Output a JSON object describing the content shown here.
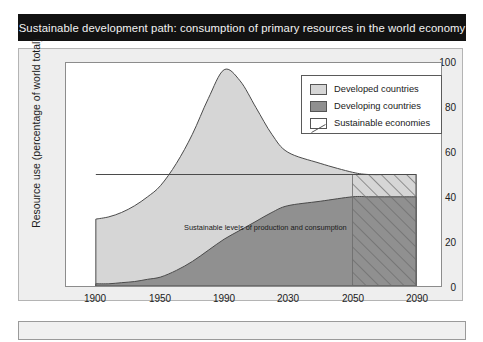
{
  "figure": {
    "title": "Sustainable development path: consumption of primary resources in the world economy",
    "background_color": "#ffffff",
    "title_bar_color": "#121212",
    "panel_color": "#eeeeee"
  },
  "legend": {
    "items": [
      {
        "label": "Developed countries",
        "color": "#d5d5d5",
        "swatch": "solid-light-gray"
      },
      {
        "label": "Developing countries",
        "color": "#8f8f8f",
        "swatch": "solid-dark-gray"
      },
      {
        "label": "Sustainable economies",
        "color": "#ffffff",
        "swatch": "diagonal-hatch"
      }
    ]
  },
  "annotation": {
    "sustainable_line_label": "Sustainable levels of production and consumption"
  },
  "chart_data": {
    "type": "area",
    "title": "Sustainable development path: consumption of primary resources in the world economy",
    "xlabel": "",
    "ylabel": "Resource use (percentage of world total)",
    "xlim": [
      1900,
      2090
    ],
    "ylim": [
      0,
      100
    ],
    "grid": false,
    "legend_position": "top-right",
    "xticks": [
      "1900",
      "1950",
      "1990",
      "2030",
      "2050",
      "2090"
    ],
    "xtick_values": [
      1900,
      1950,
      1990,
      2030,
      2050,
      2090
    ],
    "yticks": [
      "0",
      "20",
      "40",
      "60",
      "80",
      "100"
    ],
    "ytick_values": [
      0,
      20,
      40,
      60,
      80,
      100
    ],
    "x": [
      1900,
      1910,
      1920,
      1930,
      1940,
      1950,
      1960,
      1970,
      1980,
      1990,
      2000,
      2010,
      2020,
      2030,
      2040,
      2050,
      2060,
      2070,
      2080,
      2090
    ],
    "series": [
      {
        "name": "Developed countries",
        "type": "stacked-area-top",
        "note": "Upper boundary of total resource use (cumulative top of stacked bands)",
        "values": [
          30,
          31,
          33,
          36,
          40,
          45,
          55,
          68,
          84,
          97,
          92,
          80,
          68,
          60,
          55,
          51,
          50,
          50,
          50,
          50
        ]
      },
      {
        "name": "Developing countries",
        "type": "stacked-area-bottom",
        "note": "Upper boundary of the developing-countries band, measured from zero",
        "values": [
          1,
          1,
          1.5,
          2,
          3,
          4,
          7,
          11,
          16,
          21,
          25,
          29,
          33,
          36,
          38,
          40,
          40,
          40,
          40,
          40
        ]
      },
      {
        "name": "Sustainable economies",
        "type": "hatched-region",
        "note": "Diagonally hatched region from 2050 to 2090 spanning 0 to the sustainable level of 50",
        "x_start": 2050,
        "x_end": 2090,
        "y_start": 0,
        "y_end": 50
      }
    ],
    "reference_line": {
      "label": "Sustainable levels of production and consumption",
      "y": 50,
      "x_start": 1900,
      "x_end": 2090
    }
  }
}
